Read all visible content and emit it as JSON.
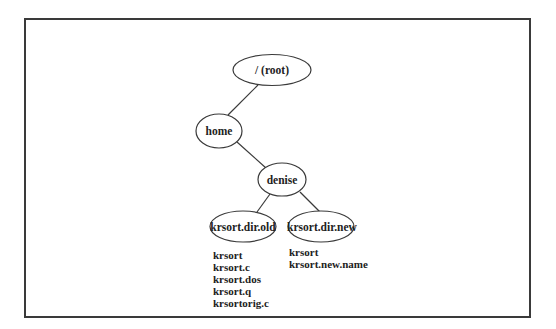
{
  "diagram": {
    "type": "directory-tree",
    "nodes": [
      {
        "id": "root",
        "label": "/ (root)"
      },
      {
        "id": "home",
        "label": "home"
      },
      {
        "id": "denise",
        "label": "denise"
      },
      {
        "id": "old",
        "label": "krsort.dir.old"
      },
      {
        "id": "new",
        "label": "krsort.dir.new"
      }
    ],
    "edges": [
      {
        "from": "root",
        "to": "home"
      },
      {
        "from": "home",
        "to": "denise"
      },
      {
        "from": "denise",
        "to": "old"
      },
      {
        "from": "denise",
        "to": "new"
      }
    ],
    "files": {
      "old": [
        "krsort",
        "krsort.c",
        "krsort.dos",
        "krsort.q",
        "krsortorig.c"
      ],
      "new": [
        "krsort",
        "krsort.new.name"
      ]
    }
  },
  "colors": {
    "stroke": "#3a3a3a",
    "text": "#222222",
    "background": "#ffffff"
  }
}
